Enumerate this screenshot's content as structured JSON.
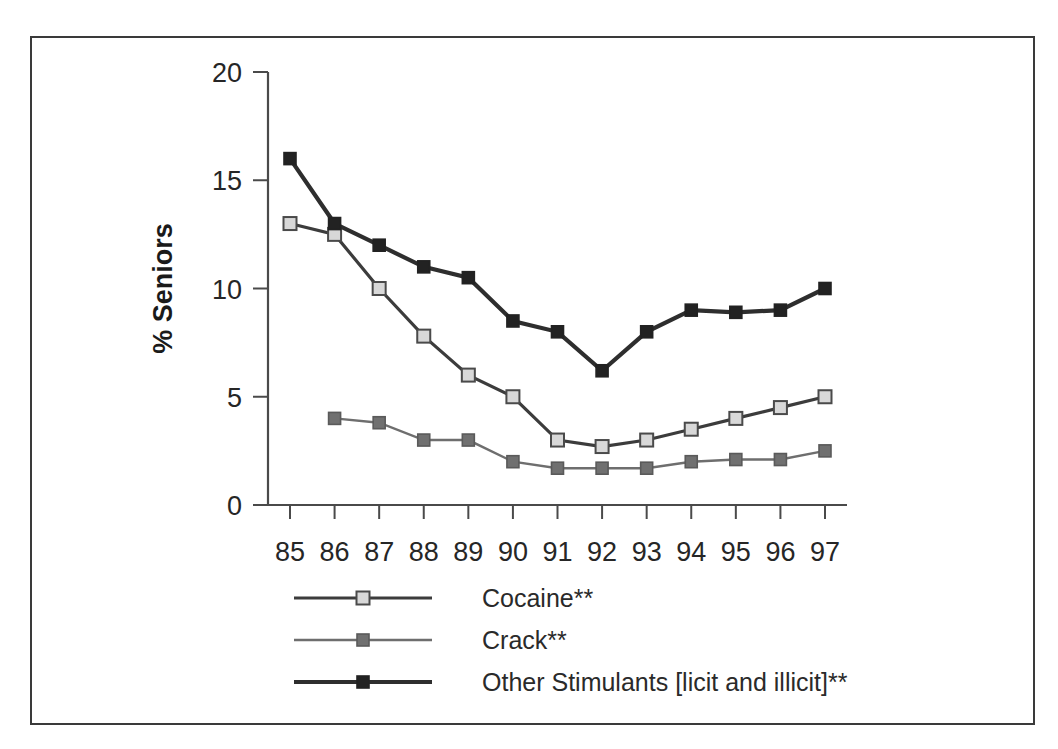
{
  "figure": {
    "background_color": "#ffffff",
    "frame_color": "#3a3a3a"
  },
  "chart_data": {
    "type": "line",
    "title": "",
    "subtitle": "",
    "xlabel": "",
    "ylabel": "% Seniors",
    "x": [
      "85",
      "86",
      "87",
      "88",
      "89",
      "90",
      "91",
      "92",
      "93",
      "94",
      "95",
      "96",
      "97"
    ],
    "categories": [
      "85",
      "86",
      "87",
      "88",
      "89",
      "90",
      "91",
      "92",
      "93",
      "94",
      "95",
      "96",
      "97"
    ],
    "xlim": [
      85,
      97
    ],
    "ylim": [
      0,
      20
    ],
    "yticks": [
      0,
      5,
      10,
      15,
      20
    ],
    "ytick_labels": [
      "0",
      "5",
      "10",
      "15",
      "20"
    ],
    "xtick_labels": [
      "85",
      "86",
      "87",
      "88",
      "89",
      "90",
      "91",
      "92",
      "93",
      "94",
      "95",
      "96",
      "97"
    ],
    "grid": false,
    "legend_position": "below-axes-left",
    "series": [
      {
        "name": "Cocaine**",
        "marker": "open-square",
        "marker_fill": "#d8d8d8",
        "line_color": "#3c3c3c",
        "line_width": "thick",
        "values": [
          13.0,
          12.5,
          10.0,
          7.8,
          6.0,
          5.0,
          3.0,
          2.7,
          3.0,
          3.5,
          4.0,
          4.5,
          5.0
        ]
      },
      {
        "name": "Crack**",
        "marker": "filled-square",
        "marker_fill": "#707070",
        "line_color": "#6e6e6e",
        "line_width": "thin",
        "values": [
          null,
          4.0,
          3.8,
          3.0,
          3.0,
          2.0,
          1.7,
          1.7,
          1.7,
          2.0,
          2.1,
          2.1,
          2.5
        ]
      },
      {
        "name": "Other Stimulants [licit and illicit]**",
        "marker": "filled-square",
        "marker_fill": "#222222",
        "line_color": "#2e2e2e",
        "line_width": "extra-thick",
        "values": [
          16.0,
          13.0,
          12.0,
          11.0,
          10.5,
          8.5,
          8.0,
          6.2,
          8.0,
          9.0,
          8.9,
          9.0,
          10.0
        ]
      }
    ]
  },
  "legend": {
    "entries": [
      {
        "label": "Cocaine**"
      },
      {
        "label": "Crack**"
      },
      {
        "label": "Other Stimulants [licit and illicit]**"
      }
    ]
  }
}
